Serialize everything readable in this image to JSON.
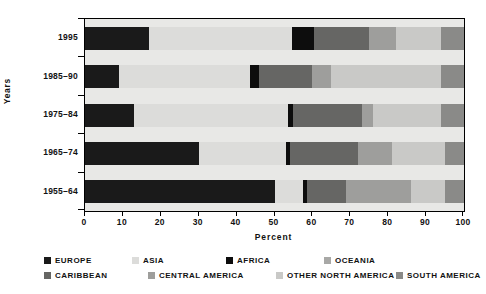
{
  "chart_data": {
    "type": "bar",
    "orientation": "horizontal",
    "stacked": true,
    "normalized": true,
    "title": "",
    "xlabel": "Percent",
    "ylabel": "Years",
    "xlim": [
      0,
      100
    ],
    "xticks": [
      0,
      10,
      20,
      30,
      40,
      50,
      60,
      70,
      80,
      90,
      100
    ],
    "xtick_labels": [
      "0",
      "10",
      "20",
      "30",
      "40",
      "50",
      "60",
      "70",
      "80",
      "90",
      "100"
    ],
    "grid": false,
    "legend_position": "bottom",
    "categories": [
      "1995",
      "1985–90",
      "1975–84",
      "1965–74",
      "1955–64"
    ],
    "series": [
      {
        "name": "Europe",
        "color": "#1a1a1a",
        "values": [
          17.0,
          9.0,
          13.0,
          30.0,
          50.0
        ]
      },
      {
        "name": "Asia",
        "color": "#dcdcda",
        "values": [
          37.5,
          34.5,
          40.5,
          23.0,
          7.5
        ]
      },
      {
        "name": "Africa",
        "color": "#0d0d0d",
        "values": [
          6.0,
          2.5,
          1.5,
          1.0,
          1.0
        ]
      },
      {
        "name": "Oceania",
        "color": "#a8a8a6",
        "values": [
          0.0,
          0.0,
          0.0,
          0.0,
          0.0
        ]
      },
      {
        "name": "Caribbean",
        "color": "#666664",
        "values": [
          14.5,
          14.0,
          18.0,
          18.0,
          10.5
        ]
      },
      {
        "name": "Central America",
        "color": "#9e9e9c",
        "values": [
          7.0,
          5.0,
          3.0,
          9.0,
          17.0
        ]
      },
      {
        "name": "Other North America",
        "color": "#c9c9c7",
        "values": [
          12.0,
          29.0,
          18.0,
          14.0,
          9.0
        ]
      },
      {
        "name": "South America",
        "color": "#8a8a88",
        "values": [
          6.0,
          6.0,
          6.0,
          5.0,
          5.0
        ]
      }
    ]
  },
  "axes": {
    "y_title": "Years",
    "x_title": "Percent"
  },
  "legend": {
    "rows": [
      [
        "Europe",
        "Asia",
        "Africa",
        "Oceania"
      ],
      [
        "Caribbean",
        "Central America",
        "Other North America",
        "South America"
      ]
    ]
  },
  "style": {
    "plot_background": "#e8e8e6",
    "frame_color": "#000000",
    "text_color": "#111111"
  }
}
